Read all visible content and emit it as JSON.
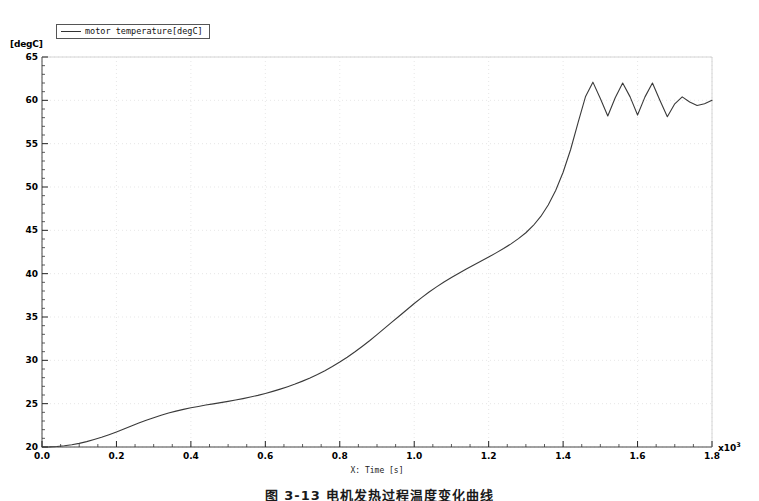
{
  "figure": {
    "y_unit_label": "[degC]",
    "x_multiplier_base": "x10",
    "x_multiplier_exp": "3",
    "caption": "图 3-13  电机发热过程温度变化曲线",
    "line_color": "#3a3a3a",
    "frame_color": "#444444",
    "grid_color": "#dcdcdc",
    "background": "#ffffff"
  },
  "legend": {
    "entries": [
      {
        "label": "motor temperature[degC]",
        "color": "#333333"
      }
    ]
  },
  "chart_data": {
    "type": "line",
    "title": "",
    "subtitle": "",
    "xlabel": "X: Time [s]",
    "ylabel": "[degC]",
    "x_multiplier": 1000,
    "xlim": [
      0.0,
      1.8
    ],
    "ylim": [
      20,
      65
    ],
    "grid": true,
    "legend_position": "top-left",
    "xticks": [
      0.0,
      0.2,
      0.4,
      0.6,
      0.8,
      1.0,
      1.2,
      1.4,
      1.6,
      1.8
    ],
    "xtick_labels": [
      "0.0",
      "0.2",
      "0.4",
      "0.6",
      "0.8",
      "1.0",
      "1.2",
      "1.4",
      "1.6",
      "1.8"
    ],
    "yticks": [
      20,
      25,
      30,
      35,
      40,
      45,
      50,
      55,
      60,
      65
    ],
    "ytick_labels": [
      "20",
      "25",
      "30",
      "35",
      "40",
      "45",
      "50",
      "55",
      "60",
      "65"
    ],
    "x_minor_tick_count": 4,
    "y_minor_tick_count": 5,
    "series": [
      {
        "name": "motor temperature[degC]",
        "color": "#3a3a3a",
        "x": [
          0.0,
          0.02,
          0.04,
          0.06,
          0.08,
          0.1,
          0.12,
          0.14,
          0.16,
          0.18,
          0.2,
          0.22,
          0.24,
          0.26,
          0.28,
          0.3,
          0.32,
          0.34,
          0.36,
          0.38,
          0.4,
          0.42,
          0.44,
          0.46,
          0.48,
          0.5,
          0.52,
          0.54,
          0.56,
          0.58,
          0.6,
          0.62,
          0.64,
          0.66,
          0.68,
          0.7,
          0.72,
          0.74,
          0.76,
          0.78,
          0.8,
          0.82,
          0.84,
          0.86,
          0.88,
          0.9,
          0.92,
          0.94,
          0.96,
          0.98,
          1.0,
          1.02,
          1.04,
          1.06,
          1.08,
          1.1,
          1.12,
          1.14,
          1.16,
          1.18,
          1.2,
          1.22,
          1.24,
          1.26,
          1.28,
          1.3,
          1.32,
          1.34,
          1.36,
          1.38,
          1.4,
          1.42,
          1.44,
          1.46,
          1.48,
          1.5,
          1.52,
          1.54,
          1.56,
          1.58,
          1.6,
          1.62,
          1.64,
          1.66,
          1.68,
          1.7,
          1.72,
          1.74,
          1.76,
          1.78,
          1.8
        ],
        "y": [
          20.0,
          20.02,
          20.06,
          20.14,
          20.26,
          20.42,
          20.62,
          20.86,
          21.12,
          21.42,
          21.74,
          22.08,
          22.42,
          22.76,
          23.08,
          23.38,
          23.66,
          23.92,
          24.14,
          24.34,
          24.52,
          24.68,
          24.84,
          24.98,
          25.12,
          25.26,
          25.42,
          25.58,
          25.76,
          25.96,
          26.18,
          26.42,
          26.68,
          26.96,
          27.26,
          27.6,
          27.96,
          28.36,
          28.8,
          29.28,
          29.8,
          30.36,
          30.96,
          31.6,
          32.26,
          32.96,
          33.68,
          34.4,
          35.12,
          35.84,
          36.56,
          37.24,
          37.88,
          38.48,
          39.04,
          39.56,
          40.06,
          40.54,
          41.0,
          41.46,
          41.92,
          42.4,
          42.9,
          43.44,
          44.04,
          44.72,
          45.56,
          46.6,
          47.92,
          49.6,
          51.7,
          54.3,
          57.4,
          60.4,
          62.1,
          60.2,
          58.2,
          60.3,
          62.0,
          60.4,
          58.3,
          60.4,
          62.0,
          60.0,
          58.1,
          59.6,
          60.4,
          59.8,
          59.4,
          59.6,
          60.0
        ]
      }
    ]
  }
}
